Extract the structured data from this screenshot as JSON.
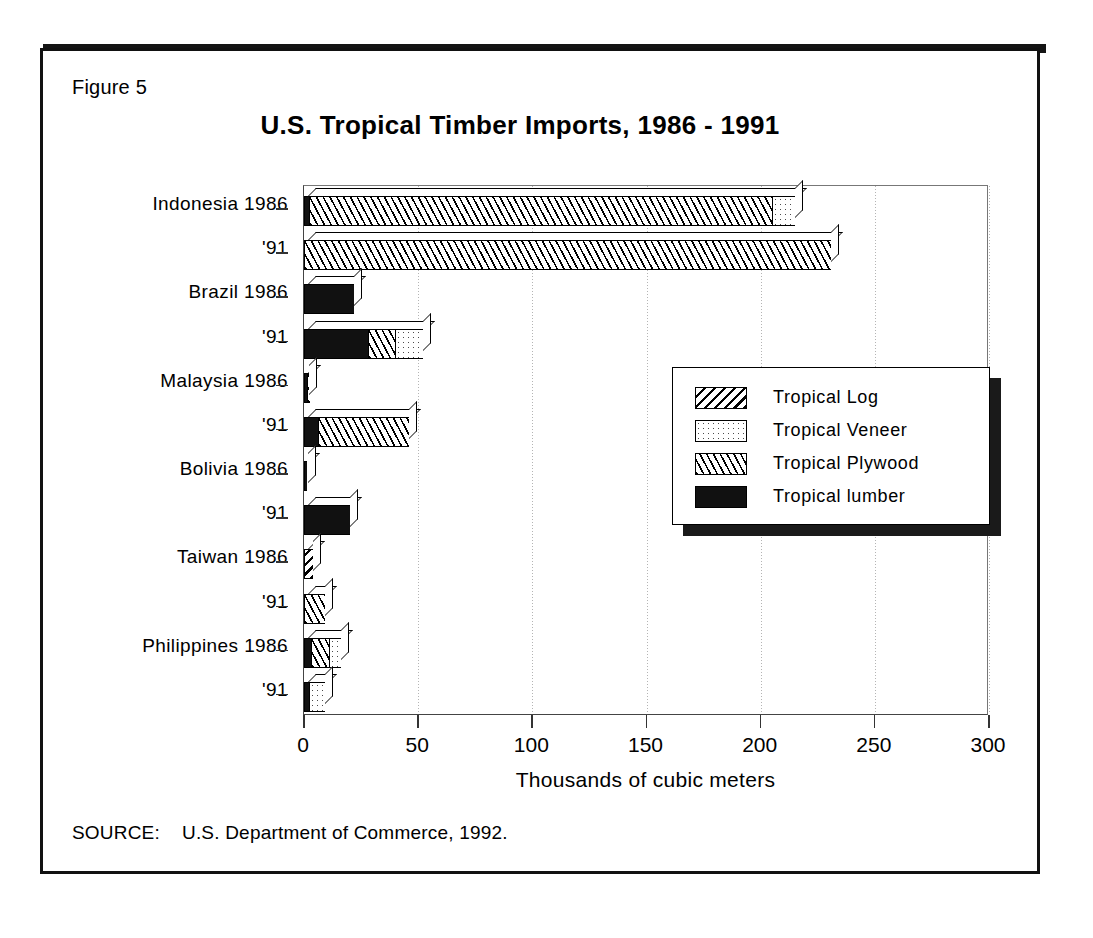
{
  "figure_label": "Figure 5",
  "source": {
    "lead": "SOURCE:",
    "text": "U.S. Department of Commerce, 1992."
  },
  "chart_data": {
    "type": "bar",
    "orientation": "horizontal",
    "stacked": true,
    "title": "U.S. Tropical Timber Imports,  1986 - 1991",
    "xlabel": "Thousands of cubic meters",
    "ylabel": "",
    "xlim": [
      0,
      300
    ],
    "xticks": [
      0,
      50,
      100,
      150,
      200,
      250,
      300
    ],
    "xticklabels": [
      "0",
      "50",
      "100",
      "150",
      "200",
      "250",
      "300"
    ],
    "grid": "vertical-dotted",
    "legend_position": "center-right",
    "legend": [
      "Tropical Log",
      "Tropical Veneer",
      "Tropical Plywood",
      "Tropical lumber"
    ],
    "categories": [
      "Indonesia 1986",
      "'91",
      "Brazil 1986",
      "'91",
      "Malaysia 1986",
      "'91",
      "Bolivia 1986",
      "'91",
      "Taiwan 1986",
      "'91",
      "Philippines 1986",
      "'91"
    ],
    "category_labels": [
      {
        "country": "Indonesia",
        "year": "1986",
        "label": "Indonesia 1986"
      },
      {
        "country": "Indonesia",
        "year": "'91",
        "label": "'91"
      },
      {
        "country": "Brazil",
        "year": "1986",
        "label": "Brazil 1986"
      },
      {
        "country": "Brazil",
        "year": "'91",
        "label": "'91"
      },
      {
        "country": "Malaysia",
        "year": "1986",
        "label": "Malaysia 1986"
      },
      {
        "country": "Malaysia",
        "year": "'91",
        "label": "'91"
      },
      {
        "country": "Bolivia",
        "year": "1986",
        "label": "Bolivia 1986"
      },
      {
        "country": "Bolivia",
        "year": "'91",
        "label": "'91"
      },
      {
        "country": "Taiwan",
        "year": "1986",
        "label": "Taiwan 1986"
      },
      {
        "country": "Taiwan",
        "year": "'91",
        "label": "'91"
      },
      {
        "country": "Philippines",
        "year": "1986",
        "label": "Philippines 1986"
      },
      {
        "country": "Philippines",
        "year": "'91",
        "label": "'91"
      }
    ],
    "series": [
      {
        "name": "Tropical lumber",
        "pattern": "solid-black",
        "values": [
          2,
          0,
          22,
          28,
          1,
          6,
          1,
          20,
          0,
          0,
          3,
          2
        ]
      },
      {
        "name": "Tropical Plywood",
        "pattern": "diagonal-hatch",
        "values": [
          203,
          231,
          0,
          12,
          1,
          40,
          0,
          0,
          0,
          9,
          8,
          0
        ]
      },
      {
        "name": "Tropical Log",
        "pattern": "dense-hatch",
        "values": [
          0,
          0,
          0,
          0,
          0,
          0,
          0,
          0,
          4,
          0,
          0,
          0
        ]
      },
      {
        "name": "Tropical Veneer",
        "pattern": "dotted",
        "values": [
          10,
          0,
          0,
          12,
          0,
          0,
          0,
          0,
          0,
          0,
          5,
          7
        ]
      }
    ],
    "stack_order": [
      "Tropical lumber",
      "Tropical Plywood",
      "Tropical Log",
      "Tropical Veneer"
    ],
    "totals": [
      215,
      231,
      22,
      52,
      2,
      46,
      1,
      20,
      4,
      9,
      16,
      9
    ]
  }
}
